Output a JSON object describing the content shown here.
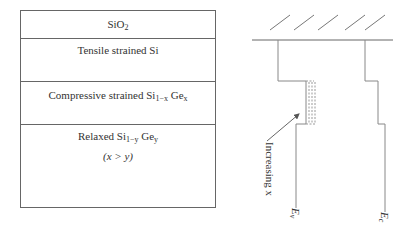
{
  "layer_stack": {
    "layers": [
      {
        "id": "sio2",
        "label_main": "SiO",
        "label_sub": "2",
        "label_tail": ""
      },
      {
        "id": "tensile",
        "label": "Tensile strained Si"
      },
      {
        "id": "compressive",
        "label_main": "Compressive strained Si",
        "label_sub1": "1−x",
        "label_mid": " Ge",
        "label_sub2": "x"
      },
      {
        "id": "relaxed",
        "label_main": "Relaxed Si",
        "label_sub1": "1−y",
        "label_mid": " Ge",
        "label_sub2": "y",
        "condition": "(x > y)"
      }
    ]
  },
  "band_diagram": {
    "annotation": "Increasing x",
    "valence_label": "E",
    "valence_sub": "v",
    "conduction_label": "E",
    "conduction_sub": "c",
    "line_color": "#888888",
    "hatch_count": 5
  }
}
